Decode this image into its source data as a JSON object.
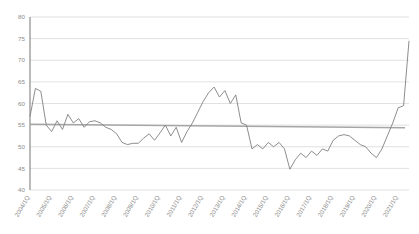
{
  "chart_data": {
    "type": "line",
    "title": "",
    "subtitle": "",
    "xlabel": "",
    "ylabel": "",
    "ylim": [
      40,
      80
    ],
    "yticks": [
      40,
      45,
      50,
      55,
      60,
      65,
      70,
      75,
      80
    ],
    "grid": true,
    "legend": "none",
    "axis_line_color": "#808080",
    "grid_color": "#d9d9d9",
    "x_tick_labels": [
      "2004/1Q",
      "2005/1Q",
      "2006/1Q",
      "2007/1Q",
      "2008/1Q",
      "2009/1Q",
      "2010/1Q",
      "2011/1Q",
      "2012/1Q",
      "2013/1Q",
      "2014/1Q",
      "2015/1Q",
      "2016/1Q",
      "2017/1Q",
      "2018/1Q",
      "2019/1Q",
      "2020/1Q",
      "2021/1Q"
    ],
    "series": [
      {
        "name": "Index",
        "color": "#808080",
        "x": [
          "2004/1Q",
          "2004/2Q",
          "2004/3Q",
          "2004/4Q",
          "2005/1Q",
          "2005/2Q",
          "2005/3Q",
          "2005/4Q",
          "2006/1Q",
          "2006/2Q",
          "2006/3Q",
          "2006/4Q",
          "2007/1Q",
          "2007/2Q",
          "2007/3Q",
          "2007/4Q",
          "2008/1Q",
          "2008/2Q",
          "2008/3Q",
          "2008/4Q",
          "2009/1Q",
          "2009/2Q",
          "2009/3Q",
          "2009/4Q",
          "2010/1Q",
          "2010/2Q",
          "2010/3Q",
          "2010/4Q",
          "2011/1Q",
          "2011/2Q",
          "2011/3Q",
          "2011/4Q",
          "2012/1Q",
          "2012/2Q",
          "2012/3Q",
          "2012/4Q",
          "2013/1Q",
          "2013/2Q",
          "2013/3Q",
          "2013/4Q",
          "2014/1Q",
          "2014/2Q",
          "2014/3Q",
          "2014/4Q",
          "2015/1Q",
          "2015/2Q",
          "2015/3Q",
          "2015/4Q",
          "2016/1Q",
          "2016/2Q",
          "2016/3Q",
          "2016/4Q",
          "2017/1Q",
          "2017/2Q",
          "2017/3Q",
          "2017/4Q",
          "2018/1Q",
          "2018/2Q",
          "2018/3Q",
          "2018/4Q",
          "2019/1Q",
          "2019/2Q",
          "2019/3Q",
          "2019/4Q",
          "2020/1Q",
          "2020/2Q",
          "2020/3Q",
          "2020/4Q",
          "2021/1Q",
          "2021/2Q",
          "2021/3Q"
        ],
        "values": [
          57.0,
          63.5,
          62.8,
          55.0,
          53.5,
          56.0,
          54.0,
          57.5,
          55.5,
          56.5,
          54.5,
          55.8,
          56.0,
          55.5,
          54.5,
          54.0,
          53.0,
          51.0,
          50.5,
          50.8,
          50.8,
          52.0,
          53.0,
          51.5,
          53.2,
          55.0,
          52.5,
          54.5,
          51.0,
          53.5,
          55.5,
          58.0,
          60.5,
          62.5,
          63.8,
          61.5,
          63.0,
          60.0,
          62.0,
          55.5,
          55.0,
          49.5,
          50.5,
          49.5,
          51.0,
          50.0,
          51.0,
          49.5,
          44.8,
          47.0,
          48.5,
          47.5,
          49.0,
          48.0,
          49.5,
          49.0,
          51.5,
          52.5,
          52.8,
          52.5,
          51.5,
          50.5,
          50.0,
          48.5,
          47.5,
          49.5,
          52.5,
          55.5,
          59.0,
          59.5,
          74.5
        ]
      }
    ],
    "trendline": {
      "name": "Average",
      "color": "#a6a6a6",
      "y_start": 55.2,
      "y_end": 54.4
    }
  }
}
